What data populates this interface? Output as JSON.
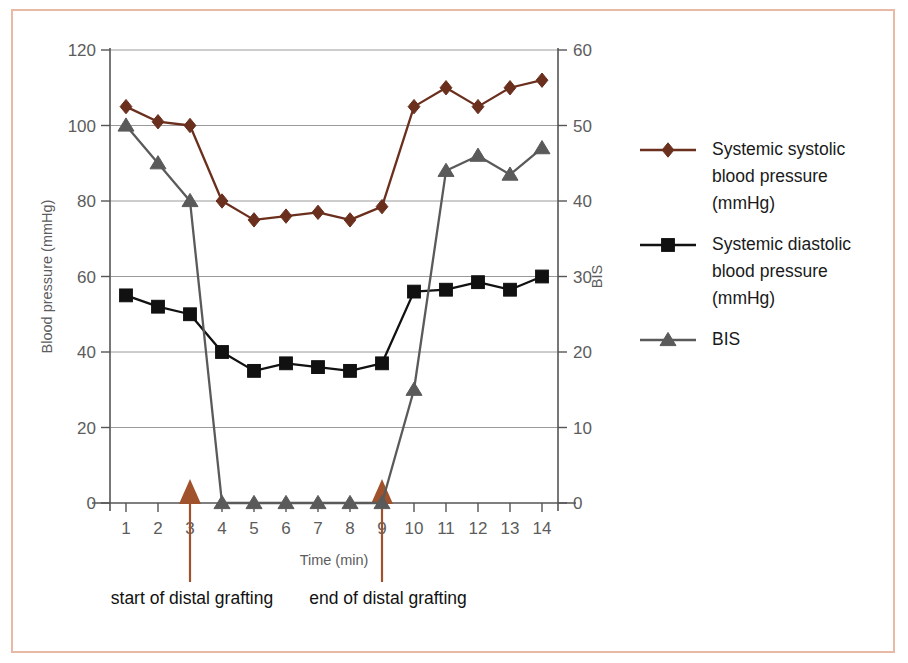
{
  "figure": {
    "border_color": "#e8b9a4",
    "background": "#ffffff"
  },
  "chart_data": {
    "type": "line",
    "title": "",
    "subtitle": "",
    "xlabel": "Time (min)",
    "ylabel": "Blood pressure (mmHg)",
    "y2label": "BIS",
    "x": [
      1,
      2,
      3,
      4,
      5,
      6,
      7,
      8,
      9,
      10,
      11,
      12,
      13,
      14
    ],
    "xtick_labels": [
      "1",
      "2",
      "3",
      "4",
      "5",
      "6",
      "7",
      "8",
      "9",
      "10",
      "11",
      "12",
      "13",
      "14"
    ],
    "xlim": [
      0.5,
      14.5
    ],
    "ylim": [
      0,
      120
    ],
    "ytick_labels": [
      "0",
      "20",
      "40",
      "60",
      "80",
      "100",
      "120"
    ],
    "ytick_values": [
      0,
      20,
      40,
      60,
      80,
      100,
      120
    ],
    "y2lim": [
      0,
      60
    ],
    "y2tick_labels": [
      "0",
      "10",
      "20",
      "30",
      "40",
      "50",
      "60"
    ],
    "y2tick_values": [
      0,
      10,
      20,
      30,
      40,
      50,
      60
    ],
    "grid": "horizontal",
    "legend_position": "right",
    "series": [
      {
        "name": "Systemic systolic blood pressure (mmHg)",
        "legend_lines": [
          "Systemic systolic",
          "blood pressure",
          "(mmHg)"
        ],
        "marker": "diamond",
        "color": "#6b2f1e",
        "axis": "left",
        "values": [
          105,
          101,
          100,
          80,
          75,
          76,
          77,
          75,
          78.5,
          105,
          110,
          105,
          110,
          112
        ]
      },
      {
        "name": "Systemic diastolic blood pressure (mmHg)",
        "legend_lines": [
          "Systemic diastolic",
          "blood pressure",
          "(mmHg)"
        ],
        "marker": "square",
        "color": "#111111",
        "axis": "left",
        "values": [
          55,
          52,
          50,
          40,
          35,
          37,
          36,
          35,
          37,
          56,
          56.5,
          58.5,
          56.5,
          60
        ]
      },
      {
        "name": "BIS",
        "legend_lines": [
          "BIS"
        ],
        "marker": "triangle",
        "color": "#5a5a5a",
        "axis": "right",
        "values": [
          50,
          45,
          40,
          0,
          0,
          0,
          0,
          0,
          0,
          15,
          44,
          46,
          43.5,
          47
        ]
      }
    ],
    "annotations": [
      {
        "label": "start of distal grafting",
        "x": 3,
        "color": "#a0522d"
      },
      {
        "label": "end of distal grafting",
        "x": 9,
        "color": "#a0522d"
      }
    ]
  }
}
